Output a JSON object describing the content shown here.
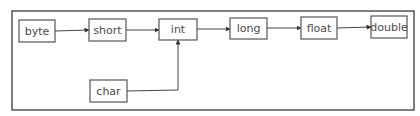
{
  "diagram": {
    "type": "flowchart",
    "colors": {
      "border": "#555555",
      "text": "#4a4a4a",
      "line": "#444444",
      "background": "#ffffff"
    },
    "nodes": [
      {
        "id": "byte",
        "label": "byte"
      },
      {
        "id": "short",
        "label": "short"
      },
      {
        "id": "int",
        "label": "int"
      },
      {
        "id": "long",
        "label": "long"
      },
      {
        "id": "float",
        "label": "float"
      },
      {
        "id": "double",
        "label": "double"
      },
      {
        "id": "char",
        "label": "char"
      }
    ],
    "edges": [
      {
        "from": "byte",
        "to": "short"
      },
      {
        "from": "short",
        "to": "int"
      },
      {
        "from": "int",
        "to": "long"
      },
      {
        "from": "long",
        "to": "float"
      },
      {
        "from": "float",
        "to": "double"
      },
      {
        "from": "char",
        "to": "int"
      }
    ]
  }
}
